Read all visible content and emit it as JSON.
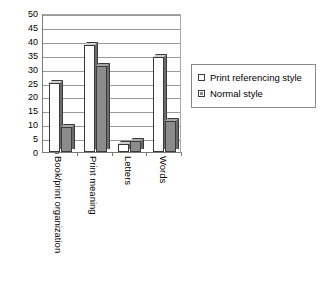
{
  "chart_data": {
    "type": "bar",
    "title": "",
    "xlabel": "",
    "ylabel": "",
    "ylim": [
      0,
      50
    ],
    "yticks": [
      0,
      5,
      10,
      15,
      20,
      25,
      30,
      35,
      40,
      45,
      50
    ],
    "grid": true,
    "legend_position": "right",
    "categories": [
      "Book/print organization",
      "Print meaning",
      "Letters",
      "Words"
    ],
    "series": [
      {
        "name": "Print referencing style",
        "color": "#ffffff",
        "values": [
          25,
          38.5,
          3,
          34
        ]
      },
      {
        "name": "Normal style",
        "color": "#8c8c8c",
        "values": [
          9,
          31,
          4,
          11
        ]
      }
    ]
  },
  "legend": {
    "entries": [
      {
        "label": "Print referencing style",
        "swatch": "hollow-square-icon"
      },
      {
        "label": "Normal style",
        "swatch": "filled-square-icon"
      }
    ]
  }
}
